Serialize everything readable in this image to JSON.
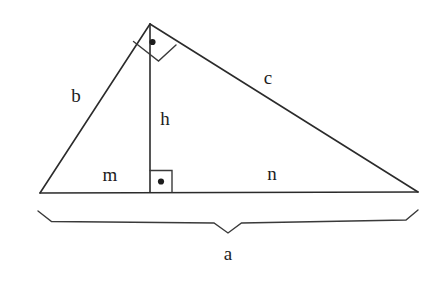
{
  "figure": {
    "type": "geometry-diagram",
    "background_color": "#ffffff",
    "stroke_color": "#2b2b2b",
    "label_color": "#1d1d1d",
    "canvas": {
      "width": 441,
      "height": 284
    },
    "labels": [
      {
        "id": "b",
        "text": "b",
        "x": 76,
        "y": 95,
        "describes": "left leg from bottom-left vertex to apex"
      },
      {
        "id": "c",
        "text": "c",
        "x": 268,
        "y": 77,
        "describes": "right leg from apex to bottom-right vertex"
      },
      {
        "id": "h",
        "text": "h",
        "x": 165,
        "y": 118,
        "describes": "altitude from apex to hypotenuse"
      },
      {
        "id": "m",
        "text": "m",
        "x": 110,
        "y": 174,
        "describes": "left segment of hypotenuse"
      },
      {
        "id": "n",
        "text": "n",
        "x": 272,
        "y": 173,
        "describes": "right segment of hypotenuse"
      },
      {
        "id": "a",
        "text": "a",
        "x": 228,
        "y": 253,
        "describes": "full hypotenuse measured by brace"
      }
    ],
    "vertices": {
      "apex": {
        "x": 150,
        "y": 24
      },
      "bottom_left": {
        "x": 40,
        "y": 193
      },
      "bottom_right": {
        "x": 418,
        "y": 192
      },
      "altitude_foot": {
        "x": 150,
        "y": 192
      }
    },
    "right_angle_marks": [
      {
        "id": "apex-right-angle",
        "at": "apex",
        "style": "rotated-square-with-dot",
        "dot": {
          "x": 152,
          "y": 42
        }
      },
      {
        "id": "foot-right-angle",
        "at": "altitude_foot",
        "style": "square-with-dot",
        "dot": {
          "x": 161,
          "y": 181
        }
      }
    ],
    "brace": {
      "id": "hypotenuse-brace",
      "left_tip": {
        "x": 38,
        "y": 211
      },
      "right_tip": {
        "x": 418,
        "y": 210
      },
      "center_notch": {
        "x": 228,
        "y": 233
      },
      "measures": "a"
    }
  }
}
